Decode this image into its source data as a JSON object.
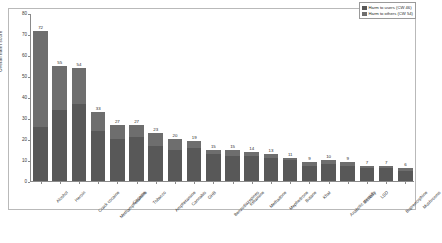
{
  "chart_data": {
    "type": "bar",
    "subtype": "stacked-bar",
    "title": "",
    "xlabel": "",
    "ylabel": "Overall harm score",
    "ylim": [
      0,
      80
    ],
    "yticks": [
      0,
      10,
      20,
      30,
      40,
      50,
      60,
      70,
      80
    ],
    "grid": false,
    "legend_position": "top-right",
    "legend": [
      {
        "name": "Harm to users (CW 46)",
        "color": "#585858"
      },
      {
        "name": "Harm to others (CW 54)",
        "color": "#6e6e6e"
      }
    ],
    "categories": [
      "Alcohol",
      "Heroin",
      "Crack cocaine",
      "Methamphetamine",
      "Cocaine",
      "Tobacco",
      "Amphetamine",
      "Cannabis",
      "GHB",
      "Benzodiazepines",
      "Ketamine",
      "Methadone",
      "Mephedrone",
      "Butane",
      "Khat",
      "Anabolic steroids",
      "Ecstasy",
      "LSD",
      "Buprenorphine",
      "Mushrooms"
    ],
    "series": [
      {
        "name": "Harm to users (CW 46)",
        "color": "#585858",
        "values": [
          26,
          34,
          37,
          24,
          20,
          21,
          17,
          15,
          16,
          13,
          12,
          12,
          11,
          10,
          7,
          8,
          7,
          6,
          6,
          5
        ]
      },
      {
        "name": "Harm to others (CW 54)",
        "color": "#6e6e6e",
        "values": [
          46,
          21,
          17,
          9,
          7,
          6,
          6,
          5,
          3,
          2,
          3,
          2,
          2,
          1,
          2,
          2,
          2,
          1,
          1,
          1
        ]
      }
    ],
    "totals": [
      72,
      55,
      54,
      33,
      27,
      27,
      23,
      20,
      19,
      15,
      15,
      14,
      13,
      11,
      9,
      10,
      9,
      7,
      7,
      6
    ],
    "value_labels": [
      "72",
      "55",
      "54",
      "33",
      "27",
      "27",
      "23",
      "20",
      "19",
      "15",
      "15",
      "14",
      "13",
      "11",
      "9",
      "10",
      "9",
      "7",
      "7",
      "6"
    ]
  }
}
